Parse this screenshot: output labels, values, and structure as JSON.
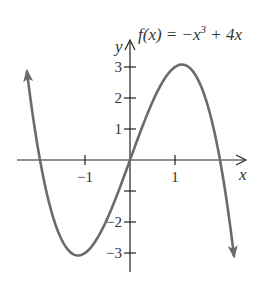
{
  "chart_data": {
    "type": "line",
    "title_parts": {
      "lhs": "f(x) = −x",
      "exp": "3",
      "rhs": " + 4x"
    },
    "xlabel": "x",
    "ylabel": "y",
    "x_ticks": [
      -1,
      1
    ],
    "x_tick_labels": [
      "−1",
      "1"
    ],
    "y_ticks": [
      3,
      2,
      1,
      -1,
      -2,
      -3
    ],
    "y_tick_labels": [
      "3",
      "2",
      "1",
      "",
      "−2",
      "−3"
    ],
    "xlim": [
      -2.5,
      2.6
    ],
    "ylim": [
      -3.6,
      3.9
    ],
    "grid": false,
    "legend": "none",
    "curve_color": "#6b6b6b",
    "axis_color": "#222222",
    "series": [
      {
        "name": "f(x) = -x^3 + 4x",
        "x": [
          -2.29,
          -2.0,
          -1.5,
          -1.155,
          -1.0,
          -0.5,
          0.0,
          0.5,
          1.0,
          1.155,
          1.5,
          2.0,
          2.31
        ],
        "y": [
          2.85,
          0.0,
          -2.625,
          -3.08,
          -3.0,
          -1.875,
          0.0,
          1.875,
          3.0,
          3.08,
          2.625,
          0.0,
          -3.09
        ]
      }
    ],
    "annotations": [
      "arrowheads at both curve ends indicating continuation"
    ]
  }
}
